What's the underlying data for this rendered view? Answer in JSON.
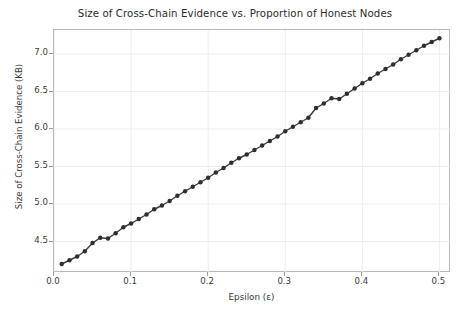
{
  "chart_data": {
    "type": "line",
    "title": "Size of Cross-Chain Evidence vs. Proportion of Honest Nodes",
    "xlabel": "Epsilon (ε)",
    "ylabel": "Size of Cross-Chain Evidence (KB)",
    "xlim": [
      0.0,
      0.515
    ],
    "ylim": [
      4.08,
      7.32
    ],
    "xticks": [
      0.0,
      0.1,
      0.2,
      0.3,
      0.4,
      0.5
    ],
    "xticklabels": [
      "0.0",
      "0.1",
      "0.2",
      "0.3",
      "0.4",
      "0.5"
    ],
    "yticks": [
      4.5,
      5.0,
      5.5,
      6.0,
      6.5,
      7.0
    ],
    "yticklabels": [
      "4.5",
      "5.0",
      "5.5",
      "6.0",
      "6.5",
      "7.0"
    ],
    "grid": true,
    "legend": null,
    "series_name": "Evidence size",
    "line_color": "#3b3b3b",
    "marker": "circle",
    "marker_color": "#2e2e2e",
    "x": [
      0.01,
      0.02,
      0.03,
      0.04,
      0.05,
      0.06,
      0.07,
      0.08,
      0.09,
      0.1,
      0.11,
      0.12,
      0.13,
      0.14,
      0.15,
      0.16,
      0.17,
      0.18,
      0.19,
      0.2,
      0.21,
      0.22,
      0.23,
      0.24,
      0.25,
      0.26,
      0.27,
      0.28,
      0.29,
      0.3,
      0.31,
      0.32,
      0.33,
      0.34,
      0.35,
      0.36,
      0.37,
      0.38,
      0.39,
      0.4,
      0.41,
      0.42,
      0.43,
      0.44,
      0.45,
      0.46,
      0.47,
      0.48,
      0.49,
      0.5
    ],
    "y": [
      4.2,
      4.25,
      4.3,
      4.37,
      4.48,
      4.55,
      4.54,
      4.61,
      4.69,
      4.74,
      4.8,
      4.86,
      4.93,
      4.98,
      5.04,
      5.11,
      5.17,
      5.23,
      5.29,
      5.35,
      5.42,
      5.48,
      5.55,
      5.61,
      5.66,
      5.72,
      5.78,
      5.84,
      5.9,
      5.97,
      6.03,
      6.09,
      6.15,
      6.28,
      6.34,
      6.41,
      6.4,
      6.47,
      6.54,
      6.61,
      6.67,
      6.74,
      6.8,
      6.86,
      6.93,
      6.99,
      7.05,
      7.11,
      7.16,
      7.21
    ]
  }
}
